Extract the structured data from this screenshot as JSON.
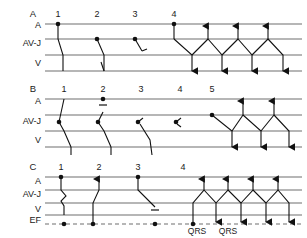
{
  "figure": {
    "type": "ladder-diagram-set",
    "panels": [
      {
        "id": "A",
        "label": "A",
        "rows": [
          "A",
          "AV-J",
          "V"
        ],
        "beat_numbers": [
          "1",
          "2",
          "3",
          "4"
        ],
        "description": "Atrial impulses 1-4 with progressive AV conduction delay then reciprocating tachycardia"
      },
      {
        "id": "B",
        "label": "B",
        "rows": [
          "A",
          "AV-J",
          "V"
        ],
        "beat_numbers": [
          "1",
          "2",
          "3",
          "4",
          "5"
        ],
        "description": "Junctional impulses with retrograde block, concealed conduction and reentry"
      },
      {
        "id": "C",
        "label": "C",
        "rows": [
          "A",
          "AV-J",
          "V",
          "EF"
        ],
        "beat_numbers": [
          "1",
          "2",
          "3",
          "4"
        ],
        "annotations": [
          "QRS",
          "QRS"
        ],
        "description": "Escape focus row with conducted, echo and blocked beats followed by reciprocating rhythm"
      }
    ],
    "row_labels": {
      "atrium": "A",
      "av_junction": "AV-J",
      "ventricle": "V",
      "escape_focus": "EF"
    },
    "annotation_labels": {
      "qrs": "QRS"
    },
    "colors": {
      "baseline": "#6e6e6e",
      "conduction": "#111111",
      "background": "#ffffff"
    }
  }
}
